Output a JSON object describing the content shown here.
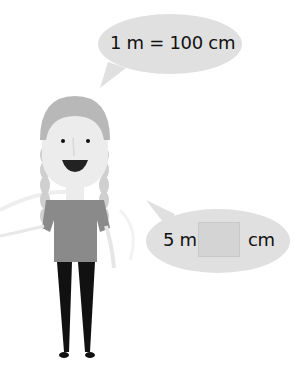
{
  "speech_bubble_top": {
    "text": "1 m = 100 cm",
    "fill": "#e0e0e0"
  },
  "speech_bubble_bottom": {
    "prefix": "5 m =",
    "suffix": "cm",
    "answer_value": "",
    "fill": "#e0e0e0",
    "box_fill": "#d4d4d4"
  },
  "character": {
    "description": "girl with braided hair",
    "colors": {
      "hair": "#b8b8b8",
      "skin": "#ececec",
      "shirt": "#8a8a8a",
      "legs": "#111111",
      "mouth": "#222222"
    }
  }
}
